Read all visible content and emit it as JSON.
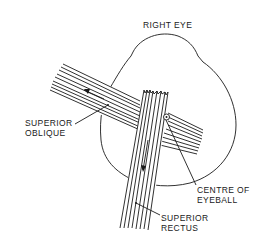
{
  "diagram": {
    "title": "RIGHT EYE",
    "labels": {
      "superior_oblique": [
        "SUPERIOR",
        "OBLIQUE"
      ],
      "centre_of_eyeball": [
        "CENTRE OF",
        "EYEBALL"
      ],
      "superior_rectus": [
        "SUPERIOR",
        "RECTUS"
      ]
    },
    "elements": [
      {
        "id": "eyeball-outline",
        "type": "outline"
      },
      {
        "id": "superior-oblique-muscle",
        "type": "muscle-band",
        "fibers": 9,
        "direction_arrow": "up-left"
      },
      {
        "id": "superior-rectus-muscle",
        "type": "muscle-band",
        "fibers": 8,
        "direction_arrow": "down"
      },
      {
        "id": "centre-of-eyeball-marker",
        "type": "circle-marker"
      }
    ],
    "colors": {
      "ink": "#1a1a1a",
      "background": "#ffffff"
    }
  }
}
